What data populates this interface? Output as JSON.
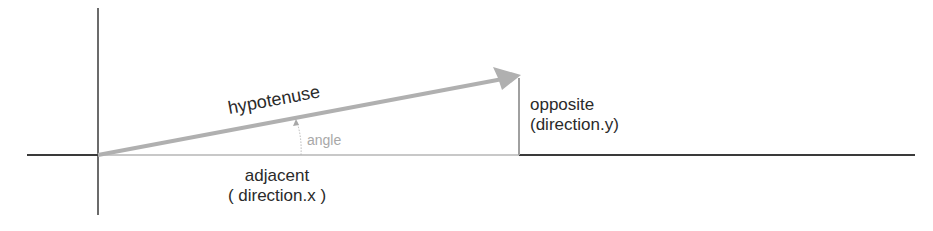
{
  "diagram": {
    "title": "",
    "labels": {
      "hypotenuse": "hypotenuse",
      "angle": "angle",
      "opposite_line1": "opposite",
      "opposite_line2": "(direction.y)",
      "adjacent_line1": "adjacent",
      "adjacent_line2": "( direction.x )"
    },
    "colors": {
      "axis": "#3a3a3a",
      "vector": "#b0b0b0",
      "opposite_line": "#a0a0a0",
      "adjacent_line": "#c8c8c8",
      "text": "#2a2a2a",
      "angle_text": "#a8a8a8"
    },
    "geometry": {
      "origin": [
        98,
        155
      ],
      "vector_tip": [
        520,
        76
      ],
      "x_axis": [
        27,
        915
      ],
      "y_axis": [
        8,
        215
      ]
    }
  }
}
